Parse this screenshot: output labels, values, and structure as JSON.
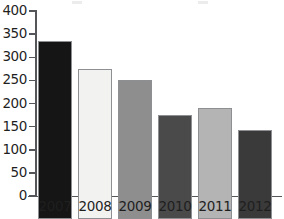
{
  "chart_data": {
    "type": "bar",
    "title": "",
    "xlabel": "",
    "ylabel": "",
    "categories": [
      "2007",
      "2008",
      "2009",
      "2010",
      "2011",
      "2012"
    ],
    "values": [
      385,
      325,
      300,
      225,
      241,
      193
    ],
    "ylim": [
      0,
      400
    ],
    "yticks": [
      0,
      50,
      100,
      150,
      200,
      250,
      300,
      350,
      400
    ],
    "ytick_labels": [
      "0",
      "50",
      "100",
      "150",
      "200",
      "250",
      "300",
      "350",
      "400"
    ],
    "grid": false,
    "legend": false,
    "bar_colors": [
      "#151515",
      "#f2f2f0",
      "#8e8e8e",
      "#4a4a4a",
      "#b4b4b4",
      "#3a3a3a"
    ],
    "bar_border_color": "#8d8f92",
    "axis_color": "#54565a",
    "background": "#ffffff",
    "series": [
      {
        "name": "values",
        "values": [
          385,
          325,
          300,
          225,
          241,
          193
        ]
      }
    ],
    "points": [
      {
        "category": "2007",
        "value": 385,
        "color": "#151515"
      },
      {
        "category": "2008",
        "value": 325,
        "color": "#f2f2f0"
      },
      {
        "category": "2009",
        "value": 300,
        "color": "#8e8e8e"
      },
      {
        "category": "2010",
        "value": 225,
        "color": "#4a4a4a"
      },
      {
        "category": "2011",
        "value": 241,
        "color": "#b4b4b4"
      },
      {
        "category": "2012",
        "value": 193,
        "color": "#3a3a3a"
      }
    ]
  }
}
